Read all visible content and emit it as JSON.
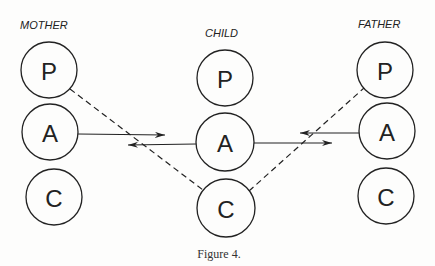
{
  "diagram": {
    "columns": [
      {
        "label": "MOTHER",
        "nodes": [
          "P",
          "A",
          "C"
        ]
      },
      {
        "label": "CHILD",
        "nodes": [
          "P",
          "A",
          "C"
        ]
      },
      {
        "label": "FATHER",
        "nodes": [
          "P",
          "A",
          "C"
        ]
      }
    ],
    "caption": "Figure 4.",
    "edges": [
      {
        "from": "MOTHER.A",
        "to": "CHILD.A",
        "style": "solid",
        "arrow": "right"
      },
      {
        "from": "CHILD.A",
        "to": "MOTHER.A",
        "style": "solid",
        "arrow": "left"
      },
      {
        "from": "CHILD.A",
        "to": "FATHER.A",
        "style": "solid",
        "arrow": "right"
      },
      {
        "from": "FATHER.A",
        "to": "CHILD.A",
        "style": "solid",
        "arrow": "left"
      },
      {
        "from": "MOTHER.P",
        "to": "CHILD.C",
        "style": "dashed"
      },
      {
        "from": "CHILD.C",
        "to": "FATHER.P",
        "style": "dashed"
      }
    ],
    "colors": {
      "ink": "#222222",
      "background": "#fdfdfc"
    }
  }
}
